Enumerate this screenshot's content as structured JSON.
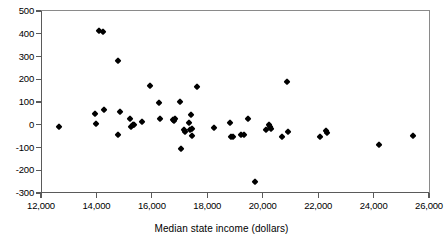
{
  "chart_data": {
    "type": "scatter",
    "title": "",
    "xlabel": "Median state income (dollars)",
    "ylabel": "",
    "xlim": [
      12000,
      26000
    ],
    "ylim": [
      -300,
      500
    ],
    "xticks": [
      "12,000",
      "14,000",
      "16,000",
      "18,000",
      "20,000",
      "22,000",
      "24,000",
      "26,000"
    ],
    "xtick_values": [
      12000,
      14000,
      16000,
      18000,
      20000,
      22000,
      24000,
      26000
    ],
    "yticks": [
      "500",
      "400",
      "300",
      "200",
      "100",
      "0",
      "-100",
      "-200",
      "-300"
    ],
    "ytick_values": [
      500,
      400,
      300,
      200,
      100,
      0,
      -100,
      -200,
      -300
    ],
    "grid": false,
    "legend": null,
    "marker": "diamond",
    "marker_color": "#000000",
    "points": [
      {
        "x": 12650,
        "y": -12
      },
      {
        "x": 13940,
        "y": 48
      },
      {
        "x": 13970,
        "y": 2
      },
      {
        "x": 14080,
        "y": 410
      },
      {
        "x": 14240,
        "y": 408
      },
      {
        "x": 14290,
        "y": 65
      },
      {
        "x": 14790,
        "y": 280
      },
      {
        "x": 14780,
        "y": -43
      },
      {
        "x": 14850,
        "y": 58
      },
      {
        "x": 15200,
        "y": 26
      },
      {
        "x": 15230,
        "y": -10
      },
      {
        "x": 15310,
        "y": 0
      },
      {
        "x": 15350,
        "y": -2
      },
      {
        "x": 15630,
        "y": 10
      },
      {
        "x": 15950,
        "y": 170
      },
      {
        "x": 16250,
        "y": 96
      },
      {
        "x": 16280,
        "y": 25
      },
      {
        "x": 16760,
        "y": 22
      },
      {
        "x": 16800,
        "y": 18
      },
      {
        "x": 16830,
        "y": 26
      },
      {
        "x": 17010,
        "y": 99
      },
      {
        "x": 17060,
        "y": -106
      },
      {
        "x": 17150,
        "y": -25
      },
      {
        "x": 17200,
        "y": -30
      },
      {
        "x": 17330,
        "y": 8
      },
      {
        "x": 17380,
        "y": -22
      },
      {
        "x": 17400,
        "y": 43
      },
      {
        "x": 17440,
        "y": -20
      },
      {
        "x": 17460,
        "y": -48
      },
      {
        "x": 17640,
        "y": 167
      },
      {
        "x": 18250,
        "y": -16
      },
      {
        "x": 18820,
        "y": 8
      },
      {
        "x": 18870,
        "y": -52
      },
      {
        "x": 18940,
        "y": -54
      },
      {
        "x": 19230,
        "y": -45
      },
      {
        "x": 19340,
        "y": -44
      },
      {
        "x": 19470,
        "y": 24
      },
      {
        "x": 19710,
        "y": -250
      },
      {
        "x": 20120,
        "y": -24
      },
      {
        "x": 20230,
        "y": -1
      },
      {
        "x": 20250,
        "y": -12
      },
      {
        "x": 20290,
        "y": -20
      },
      {
        "x": 20700,
        "y": -56
      },
      {
        "x": 20880,
        "y": 186
      },
      {
        "x": 20900,
        "y": -30
      },
      {
        "x": 22080,
        "y": -56
      },
      {
        "x": 22300,
        "y": -28
      },
      {
        "x": 22330,
        "y": -38
      },
      {
        "x": 24190,
        "y": -88
      },
      {
        "x": 25430,
        "y": -50
      }
    ]
  }
}
